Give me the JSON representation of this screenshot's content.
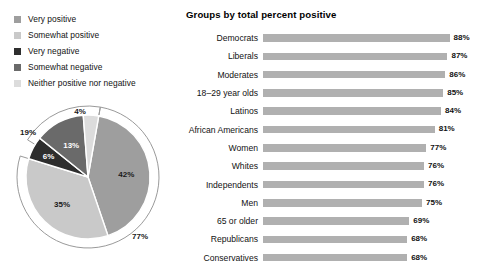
{
  "legend": {
    "items": [
      {
        "label": "Very positive",
        "color": "#9e9e9e",
        "icon": "legend-swatch-icon"
      },
      {
        "label": "Somewhat positive",
        "color": "#c9c9c9",
        "icon": "legend-swatch-icon"
      },
      {
        "label": "Very negative",
        "color": "#2e2e2e",
        "icon": "legend-swatch-icon"
      },
      {
        "label": "Somewhat negative",
        "color": "#6a6a6a",
        "icon": "legend-swatch-icon"
      },
      {
        "label": "Neither positive nor negative",
        "color": "#dcdcdc",
        "icon": "legend-swatch-icon"
      }
    ]
  },
  "chart_data": [
    {
      "type": "pie",
      "title": "",
      "categories": [
        "Very positive",
        "Somewhat positive",
        "Neither positive nor negative",
        "Somewhat negative",
        "Very negative"
      ],
      "values": [
        42,
        35,
        6,
        13,
        4
      ],
      "labels": [
        "42%",
        "35%",
        "6%",
        "13%",
        "4%"
      ],
      "colors": [
        "#9e9e9e",
        "#c9c9c9",
        "#2e2e2e",
        "#6a6a6a",
        "#dcdcdc"
      ],
      "label_colors": [
        "#1a1a1a",
        "#1a1a1a",
        "#ffffff",
        "#ffffff",
        "#1a1a1a"
      ],
      "annotations": [
        {
          "text": "77%",
          "meaning": "total positive arc",
          "value": 77
        },
        {
          "text": "19%",
          "meaning": "total negative arc",
          "value": 19
        }
      ],
      "legend_position": "above"
    },
    {
      "type": "bar",
      "orientation": "horizontal",
      "title": "Groups by total percent positive",
      "xlabel": "",
      "ylabel": "",
      "xlim": [
        0,
        100
      ],
      "grid": false,
      "bar_color": "#b0b0b0",
      "categories": [
        "Democrats",
        "Liberals",
        "Moderates",
        "18–29 year olds",
        "Latinos",
        "African Americans",
        "Women",
        "Whites",
        "Independents",
        "Men",
        "65 or older",
        "Republicans",
        "Conservatives"
      ],
      "values": [
        88,
        87,
        86,
        85,
        84,
        81,
        77,
        76,
        76,
        75,
        69,
        68,
        68
      ],
      "value_labels": [
        "88%",
        "87%",
        "86%",
        "85%",
        "84%",
        "81%",
        "77%",
        "76%",
        "76%",
        "75%",
        "69%",
        "68%",
        "68%"
      ]
    }
  ]
}
